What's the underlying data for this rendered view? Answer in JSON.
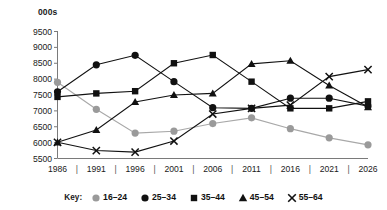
{
  "chart_data": {
    "type": "line",
    "title": "",
    "subtitle": "",
    "xlabel": "",
    "ylabel": "000s",
    "unit_label": "000s",
    "categories": [
      "1986",
      "1991",
      "1996",
      "2001",
      "2006",
      "2011",
      "2016",
      "2021",
      "2026"
    ],
    "x": [
      1986,
      1991,
      1996,
      2001,
      2006,
      2011,
      2016,
      2021,
      2026
    ],
    "ylim": [
      5500,
      9500
    ],
    "yticks": [
      9500,
      9000,
      8500,
      8000,
      7500,
      7000,
      6500,
      6000,
      5500
    ],
    "ytick_labels": [
      "9500",
      "9000",
      "8500",
      "8000",
      "7500",
      "7000",
      "6500",
      "6000",
      "5500"
    ],
    "grid": false,
    "legend_position": "bottom",
    "legend_title": "Key:",
    "x_separator": "|",
    "series": [
      {
        "name": "16–24",
        "marker": "circle",
        "color": "#9a9a9a",
        "line_color": "#a8a8a8",
        "values": [
          7900,
          7050,
          6300,
          6360,
          6600,
          6780,
          6440,
          6150,
          5930
        ]
      },
      {
        "name": "25–34",
        "marker": "circle",
        "color": "#111111",
        "line_color": "#111111",
        "values": [
          7600,
          8450,
          8750,
          7920,
          7100,
          7080,
          7400,
          7400,
          7150
        ]
      },
      {
        "name": "35–44",
        "marker": "square",
        "color": "#111111",
        "line_color": "#111111",
        "values": [
          7440,
          7550,
          7620,
          8500,
          8760,
          7920,
          7080,
          7080,
          7300
        ]
      },
      {
        "name": "45–54",
        "marker": "triangle",
        "color": "#111111",
        "line_color": "#111111",
        "values": [
          6010,
          6400,
          7280,
          7500,
          7550,
          8480,
          8580,
          7800,
          7120
        ]
      },
      {
        "name": "55–64",
        "marker": "cross",
        "color": "#111111",
        "line_color": "#111111",
        "values": [
          6010,
          5750,
          5700,
          6050,
          6900,
          7080,
          7180,
          8080,
          8300
        ]
      }
    ]
  },
  "axis": {
    "y_axis_name": "y-axis",
    "x_axis_name": "x-axis"
  }
}
